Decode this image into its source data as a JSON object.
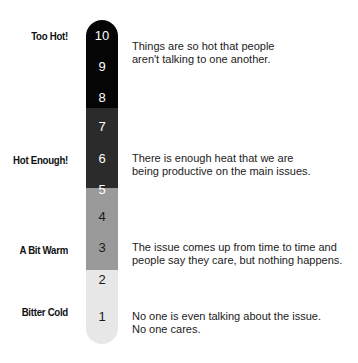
{
  "diagram": {
    "type": "thermometer-scale",
    "scale": [
      "10",
      "9",
      "8",
      "7",
      "6",
      "5",
      "4",
      "3",
      "2",
      "1"
    ],
    "levels": [
      {
        "label": "Too Hot!",
        "range": [
          8,
          10
        ],
        "color": "#050505",
        "description_line1": "Things are so hot that people",
        "description_line2": "aren't talking to one another."
      },
      {
        "label": "Hot Enough!",
        "range": [
          5,
          7
        ],
        "color": "#2b2b2b",
        "description_line1": "There is enough heat that we are",
        "description_line2": "being productive on the main issues."
      },
      {
        "label": "A Bit Warm",
        "range": [
          2,
          4
        ],
        "color": "#9a9a9a",
        "description_line1": "The issue comes up from time to time and",
        "description_line2": "people say they care, but nothing happens."
      },
      {
        "label": "Bitter Cold",
        "range": [
          1,
          1
        ],
        "color": "#e7e7e7",
        "description_line1": "No one is even talking about the issue.",
        "description_line2": "No one cares."
      }
    ]
  }
}
